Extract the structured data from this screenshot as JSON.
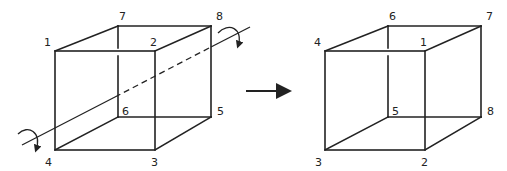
{
  "diagram": {
    "left_cube": {
      "labels": {
        "v1": "1",
        "v2": "2",
        "v3": "3",
        "v4": "4",
        "v5": "5",
        "v6": "6",
        "v7": "7",
        "v8": "8"
      }
    },
    "right_cube": {
      "labels": {
        "v1": "4",
        "v2": "1",
        "v3": "2",
        "v4": "3",
        "v5": "8",
        "v6": "5",
        "v7": "6",
        "v8": "7"
      }
    },
    "arrow": "transform-arrow",
    "colors": {
      "line": "#222222",
      "background": "#ffffff"
    }
  }
}
